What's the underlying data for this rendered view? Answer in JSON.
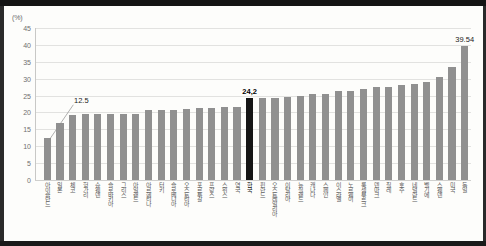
{
  "chart_data": {
    "type": "bar",
    "title": "",
    "subtitle": "",
    "xlabel": "",
    "ylabel": "(%)",
    "unit": "(%)",
    "ylim": [
      0,
      45
    ],
    "ytick_step": 5,
    "yticks": [
      "0",
      "5",
      "10",
      "15",
      "20",
      "25",
      "30",
      "35",
      "40",
      "45"
    ],
    "grid": true,
    "legend": false,
    "bar_color": "#909090",
    "highlight_color": "#151515",
    "highlight_category": "한국",
    "categories": [
      "아이슬란드",
      "일본",
      "체코",
      "헝가리",
      "슈웨덴",
      "슬로바키아",
      "그리스",
      "아일랜드",
      "아르헨티나",
      "터키",
      "슬로베니아",
      "오스트리아",
      "포르투갈",
      "프랑스",
      "스위스",
      "영국",
      "한국",
      "핀란드",
      "오스트레일리아",
      "이탈리아",
      "뉴질랜드",
      "캐나다",
      "스페인",
      "이스라엘",
      "노르웨이",
      "룩셈부르크",
      "덴마크",
      "칠레",
      "호주",
      "네덜란드",
      "벨기에",
      "스웨덴",
      "미국",
      "독일"
    ],
    "values": [
      12.5,
      17.0,
      19.2,
      19.4,
      19.5,
      19.6,
      19.6,
      19.6,
      20.6,
      20.7,
      20.8,
      20.9,
      21.3,
      21.4,
      21.5,
      21.6,
      24.2,
      24.3,
      24.4,
      24.5,
      24.9,
      25.5,
      25.6,
      26.3,
      26.4,
      27.0,
      27.4,
      27.5,
      28.2,
      28.4,
      29.0,
      30.6,
      33.5,
      39.54
    ],
    "annotations": [
      {
        "index": 0,
        "text": "12.5",
        "bold": false,
        "leader": true
      },
      {
        "index": 16,
        "text": "24,2",
        "bold": true,
        "leader": false
      },
      {
        "index": 33,
        "text": "39.54",
        "bold": false,
        "leader": false
      }
    ]
  }
}
